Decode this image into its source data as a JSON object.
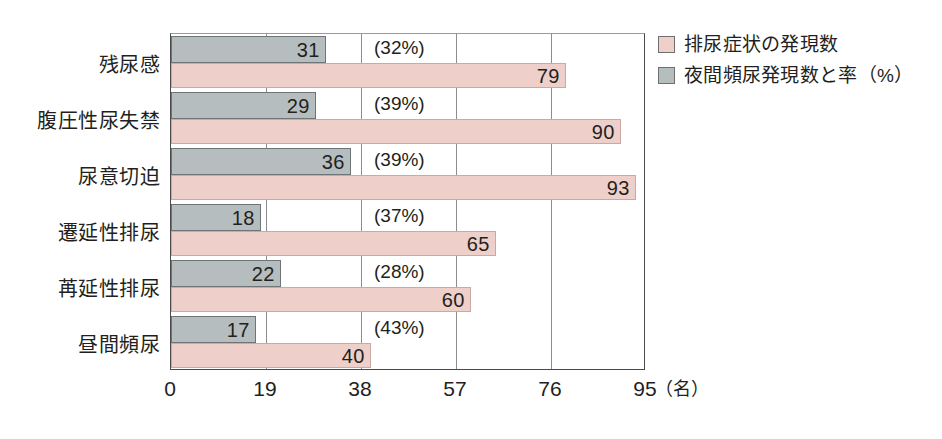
{
  "chart_data": {
    "type": "bar",
    "orientation": "horizontal",
    "title": "",
    "xlabel": "(名)",
    "ylabel": "",
    "xlim": [
      0,
      95
    ],
    "xticks": [
      0,
      19,
      38,
      57,
      76,
      95
    ],
    "xtick_labels": [
      "0",
      "19",
      "38",
      "57",
      "76",
      "95"
    ],
    "unit_label": "（名）",
    "grid": true,
    "legend_position": "right",
    "categories": [
      "残尿感",
      "腹圧性尿失禁",
      "尿意切迫",
      "遷延性排尿",
      "苒延性排尿",
      "昼間頻尿"
    ],
    "series": [
      {
        "name": "夜間頻尿発現数と率（%）",
        "color": "#b6bdbe",
        "values": [
          31,
          29,
          36,
          18,
          22,
          17
        ],
        "value_labels": [
          "31",
          "29",
          "36",
          "18",
          "22",
          "17"
        ]
      },
      {
        "name": "排尿症状の発現数",
        "color": "#eecfc9",
        "values": [
          79,
          90,
          93,
          65,
          60,
          40
        ],
        "value_labels": [
          "79",
          "90",
          "93",
          "65",
          "60",
          "40"
        ]
      }
    ],
    "annotations": {
      "percent_labels": [
        "(32%)",
        "(39%)",
        "(39%)",
        "(37%)",
        "(28%)",
        "(43%)"
      ]
    }
  },
  "legend": {
    "items": [
      {
        "label": "排尿症状の発現数",
        "color": "#eecfc9"
      },
      {
        "label": "夜間頻尿発現数と率（%）",
        "color": "#b6bdbe"
      }
    ]
  }
}
